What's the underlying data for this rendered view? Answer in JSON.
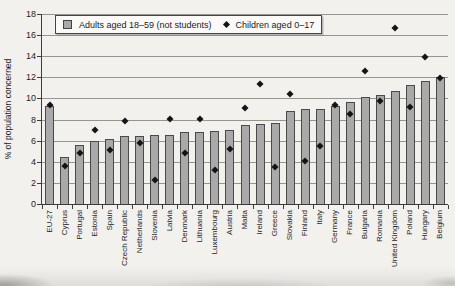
{
  "figure": {
    "background_color": "#f2f1ee",
    "bar_color": "#a9a9a9",
    "bar_border_color": "#4a4a4a",
    "marker_color": "#141414",
    "gridline_color": "#979590"
  },
  "chart_data": {
    "type": "bar",
    "title": "",
    "xlabel": "",
    "ylabel": "% of population concerned",
    "ylim": [
      0,
      18
    ],
    "ytick_step": 2,
    "grid": true,
    "legend_position": "top-inside",
    "categories": [
      "EU-27",
      "Cyprus",
      "Portugal",
      "Estonia",
      "Spain",
      "Czech Republic",
      "Netherlands",
      "Slovenia",
      "Latvia",
      "Denmark",
      "Lithuania",
      "Luxembourg",
      "Austria",
      "Malta",
      "Ireland",
      "Greece",
      "Slovakia",
      "Finland",
      "Italy",
      "Germany",
      "France",
      "Bulgaria",
      "Romania",
      "United Kingdom",
      "Poland",
      "Hungary",
      "Belgium"
    ],
    "series": [
      {
        "name": "Adults aged 18–59 (not students)",
        "type": "bar",
        "color": "#a9a9a9",
        "values": [
          9.3,
          4.5,
          5.6,
          6.0,
          6.2,
          6.4,
          6.4,
          6.5,
          6.5,
          6.8,
          6.8,
          6.9,
          7.0,
          7.5,
          7.6,
          7.7,
          8.8,
          9.0,
          9.0,
          9.3,
          9.7,
          10.1,
          10.3,
          10.7,
          11.3,
          11.7,
          12.0
        ]
      },
      {
        "name": "Children aged 0–17",
        "type": "scatter-diamond",
        "color": "#141414",
        "values": [
          9.4,
          3.6,
          4.8,
          7.0,
          5.1,
          7.9,
          5.8,
          2.3,
          8.1,
          4.8,
          8.1,
          3.2,
          5.2,
          9.1,
          11.4,
          3.5,
          10.4,
          4.1,
          5.5,
          9.4,
          8.5,
          12.6,
          9.8,
          16.7,
          9.2,
          13.9,
          11.9
        ]
      }
    ]
  }
}
